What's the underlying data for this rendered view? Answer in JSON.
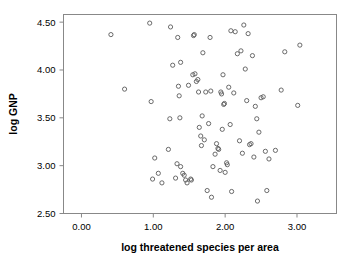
{
  "chart_data": {
    "type": "scatter",
    "title": "",
    "xlabel": "log threatened species per area",
    "ylabel": "log GNP",
    "xlim": [
      -0.25,
      3.55
    ],
    "ylim": [
      2.5,
      4.58
    ],
    "xticks": [
      0.0,
      1.0,
      2.0,
      3.0
    ],
    "xtick_labels": [
      "0.00",
      "1.00",
      "2.00",
      "3.00"
    ],
    "yticks": [
      2.5,
      3.0,
      3.5,
      4.0,
      4.5
    ],
    "ytick_labels": [
      "2.50",
      "3.00",
      "3.50",
      "4.00",
      "4.50"
    ],
    "grid": false,
    "legend": null,
    "marker": "open-circle",
    "marker_color": "#5a5a5a",
    "points": [
      [
        0.41,
        4.37
      ],
      [
        0.6,
        3.8
      ],
      [
        0.95,
        4.49
      ],
      [
        0.97,
        3.67
      ],
      [
        0.99,
        2.86
      ],
      [
        1.02,
        3.08
      ],
      [
        1.07,
        2.92
      ],
      [
        1.12,
        2.82
      ],
      [
        1.21,
        3.17
      ],
      [
        1.23,
        3.49
      ],
      [
        1.24,
        4.45
      ],
      [
        1.27,
        4.05
      ],
      [
        1.31,
        2.87
      ],
      [
        1.33,
        3.02
      ],
      [
        1.34,
        4.34
      ],
      [
        1.35,
        3.83
      ],
      [
        1.36,
        3.73
      ],
      [
        1.37,
        3.5
      ],
      [
        1.38,
        2.99
      ],
      [
        1.38,
        4.08
      ],
      [
        1.41,
        2.92
      ],
      [
        1.43,
        2.9
      ],
      [
        1.45,
        2.85
      ],
      [
        1.47,
        2.82
      ],
      [
        1.49,
        3.84
      ],
      [
        1.52,
        2.86
      ],
      [
        1.53,
        2.85
      ],
      [
        1.55,
        3.95
      ],
      [
        1.56,
        4.36
      ],
      [
        1.57,
        4.37
      ],
      [
        1.58,
        3.96
      ],
      [
        1.6,
        3.88
      ],
      [
        1.62,
        3.9
      ],
      [
        1.63,
        3.77
      ],
      [
        1.64,
        3.4
      ],
      [
        1.66,
        3.31
      ],
      [
        1.67,
        3.21
      ],
      [
        1.68,
        3.52
      ],
      [
        1.69,
        4.18
      ],
      [
        1.71,
        3.27
      ],
      [
        1.73,
        3.77
      ],
      [
        1.75,
        2.74
      ],
      [
        1.77,
        3.44
      ],
      [
        1.79,
        4.34
      ],
      [
        1.8,
        3.78
      ],
      [
        1.81,
        2.67
      ],
      [
        1.83,
        2.99
      ],
      [
        1.86,
        3.12
      ],
      [
        1.88,
        3.23
      ],
      [
        1.9,
        3.18
      ],
      [
        1.91,
        3.17
      ],
      [
        1.93,
        2.95
      ],
      [
        1.94,
        3.77
      ],
      [
        1.95,
        3.75
      ],
      [
        1.96,
        3.38
      ],
      [
        1.97,
        3.95
      ],
      [
        1.98,
        3.64
      ],
      [
        1.99,
        3.65
      ],
      [
        2.0,
        2.93
      ],
      [
        2.02,
        3.03
      ],
      [
        2.03,
        3.01
      ],
      [
        2.05,
        3.82
      ],
      [
        2.07,
        3.43
      ],
      [
        2.08,
        4.41
      ],
      [
        2.09,
        2.73
      ],
      [
        2.12,
        3.76
      ],
      [
        2.14,
        4.4
      ],
      [
        2.17,
        4.17
      ],
      [
        2.2,
        3.26
      ],
      [
        2.22,
        4.2
      ],
      [
        2.24,
        3.13
      ],
      [
        2.26,
        4.47
      ],
      [
        2.28,
        4.01
      ],
      [
        2.3,
        3.68
      ],
      [
        2.32,
        4.38
      ],
      [
        2.34,
        3.22
      ],
      [
        2.36,
        3.23
      ],
      [
        2.38,
        4.15
      ],
      [
        2.4,
        3.09
      ],
      [
        2.42,
        3.62
      ],
      [
        2.44,
        3.49
      ],
      [
        2.45,
        2.63
      ],
      [
        2.47,
        3.35
      ],
      [
        2.5,
        3.71
      ],
      [
        2.53,
        3.72
      ],
      [
        2.56,
        3.15
      ],
      [
        2.58,
        2.74
      ],
      [
        2.61,
        3.07
      ],
      [
        2.7,
        3.16
      ],
      [
        2.78,
        3.79
      ],
      [
        2.83,
        4.19
      ],
      [
        3.01,
        3.63
      ],
      [
        3.04,
        4.26
      ]
    ],
    "n_points": 93
  }
}
